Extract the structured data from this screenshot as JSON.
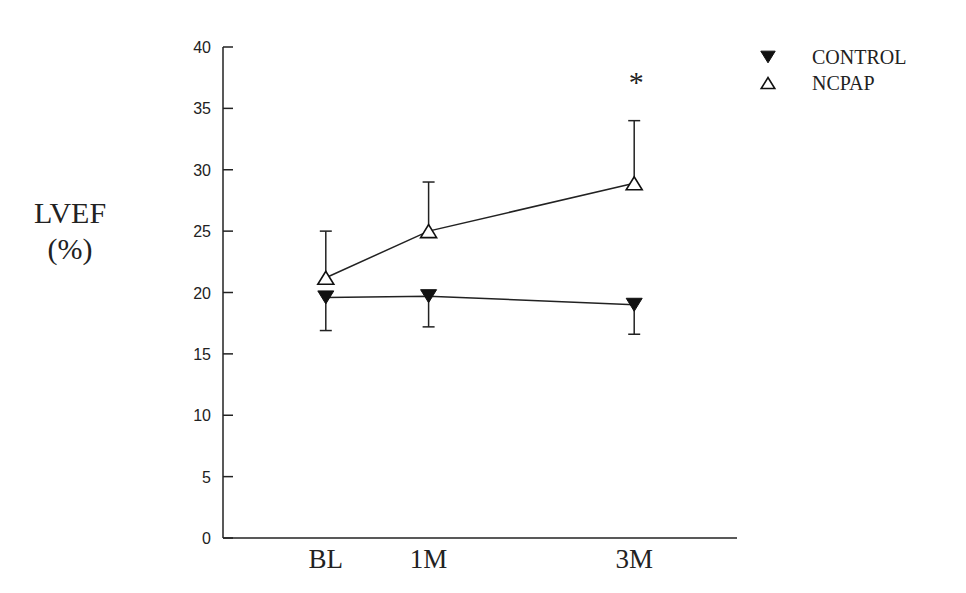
{
  "chart_data": {
    "type": "line",
    "title": "",
    "xlabel": "",
    "ylabel": "LVEF (%)",
    "ylabel_lines": [
      "LVEF",
      "(%)"
    ],
    "categories": [
      "BL",
      "1M",
      "3M"
    ],
    "x_positions_relative": [
      0.2,
      0.4,
      0.8
    ],
    "ylim": [
      0,
      40
    ],
    "yticks": [
      0,
      5,
      10,
      15,
      20,
      25,
      30,
      35,
      40
    ],
    "grid": false,
    "legend_position": "upper-right",
    "series": [
      {
        "name": "CONTROL",
        "marker": "filled-down-triangle",
        "values": [
          19.6,
          19.7,
          19.0
        ],
        "error_lower": [
          16.9,
          17.2,
          16.6
        ],
        "error_direction": "down"
      },
      {
        "name": "NCPAP",
        "marker": "open-up-triangle",
        "values": [
          21.2,
          25.0,
          28.9
        ],
        "error_upper": [
          25.0,
          29.0,
          34.0
        ],
        "error_direction": "up"
      }
    ],
    "annotations": [
      {
        "text": "*",
        "category": "3M",
        "series": "NCPAP",
        "meaning": "significance marker"
      }
    ]
  }
}
